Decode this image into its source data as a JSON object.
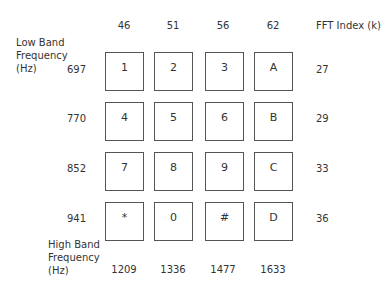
{
  "diagram": {
    "title_low": [
      "Low Band",
      "Frequency",
      "(Hz)"
    ],
    "title_high": [
      "High Band",
      "Frequency",
      "(Hz)"
    ],
    "fft_label": "FFT  Index  (k)",
    "column_fft_index": [
      "46",
      "51",
      "56",
      "62"
    ],
    "row_freqs": [
      "697",
      "770",
      "852",
      "941"
    ],
    "row_fft_index": [
      "27",
      "29",
      "33",
      "36"
    ],
    "column_freqs": [
      "1209",
      "1336",
      "1477",
      "1633"
    ],
    "keys": [
      [
        "1",
        "2",
        "3",
        "A"
      ],
      [
        "4",
        "5",
        "6",
        "B"
      ],
      [
        "7",
        "8",
        "9",
        "C"
      ],
      [
        "*",
        "0",
        "#",
        "D"
      ]
    ]
  }
}
